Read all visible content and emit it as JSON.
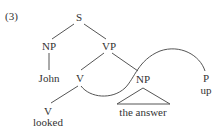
{
  "example_number": "(3)",
  "tree": {
    "root": "S",
    "subject_np": "NP",
    "vp": "VP",
    "subject_word": "John",
    "v_upper": "V",
    "object_np": "NP",
    "particle_category": "P",
    "particle_word": "up",
    "v_lower": "V",
    "verb_word": "looked",
    "object_phrase": "the answer"
  },
  "colors": {
    "line": "#555555",
    "text": "#333333"
  }
}
